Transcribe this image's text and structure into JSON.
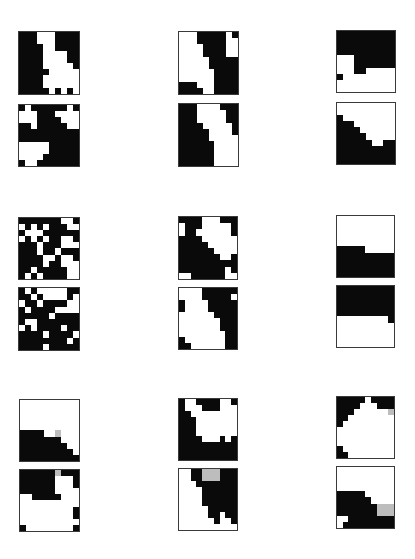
{
  "figure": {
    "layout": "3 rows x 3 columns of panel pairs; each pair = two stacked 10x10 binary grids",
    "colors": {
      "on": "#0a0a0a",
      "off": "#ffffff",
      "border": "#3a3a3a",
      "artifact": "#bdbdbd"
    },
    "panels": [
      {
        "id": "r1c1-top",
        "x": 18,
        "y": 31,
        "w": 62,
        "h": 64,
        "grid": [
          "1110001111",
          "1110001111",
          "1111001111",
          "1111000011",
          "1111000011",
          "1111000001",
          "1111100000",
          "1111000000",
          "1111000000",
          "1111101010"
        ]
      },
      {
        "id": "r1c1-bottom",
        "x": 18,
        "y": 104,
        "w": 62,
        "h": 63,
        "grid": [
          "1011111101",
          "0001110000",
          "0001111000",
          "1101111100",
          "1111111111",
          "1111111111",
          "0000011111",
          "0000011111",
          "0000111111",
          "1001111111"
        ]
      },
      {
        "id": "r1c2-top",
        "x": 178,
        "y": 31,
        "w": 61,
        "h": 64,
        "grid": [
          "0001111101",
          "0001111100",
          "0000111100",
          "0000111100",
          "0000011111",
          "0000011111",
          "0000001111",
          "0000001111",
          "1110001111",
          "1111001111"
        ]
      },
      {
        "id": "r1c2-bottom",
        "x": 178,
        "y": 103,
        "w": 61,
        "h": 64,
        "grid": [
          "1110000111",
          "1110000011",
          "1110000011",
          "1111000001",
          "1111100001",
          "1111100000",
          "1111110000",
          "1111110000",
          "1111110000",
          "1111110000"
        ]
      },
      {
        "id": "r1c3-top",
        "x": 336,
        "y": 30,
        "w": 60,
        "h": 63,
        "grid": [
          "1111111111",
          "1111111111",
          "1111111111",
          "1111111111",
          "0001111111",
          "0001111111",
          "0001100000",
          "1000000000",
          "0000000000",
          "0000000000"
        ]
      },
      {
        "id": "r1c3-bottom",
        "x": 336,
        "y": 102,
        "w": 60,
        "h": 63,
        "grid": [
          "0000000000",
          "0000000000",
          "1000000000",
          "1110000000",
          "1111000000",
          "1111100000",
          "1111110011",
          "1111111111",
          "1111111111",
          "1111111111"
        ]
      },
      {
        "id": "r2c1-top",
        "x": 18,
        "y": 217,
        "w": 62,
        "h": 63,
        "grid": [
          "1111111001",
          "0101011100",
          "1000111111",
          "0101011001",
          "1110111000",
          "1110110111",
          "1111001001",
          "1111011000",
          "1101111100",
          "1010111100"
        ]
      },
      {
        "id": "r2c1-bottom",
        "x": 18,
        "y": 287,
        "w": 62,
        "h": 64,
        "grid": [
          "1010000011",
          "1101000010",
          "0110111100",
          "1011110000",
          "1111101111",
          "1001111111",
          "0101111011",
          "1111011110",
          "1111111101",
          "1111011111"
        ]
      },
      {
        "id": "r2c2-top",
        "x": 178,
        "y": 216,
        "w": 60,
        "h": 64,
        "grid": [
          "1111000111",
          "0111000001",
          "0110000001",
          "1111000000",
          "1111100000",
          "1111110000",
          "1111111001",
          "1111111111",
          "1111111101",
          "0011111100"
        ]
      },
      {
        "id": "r2c2-bottom",
        "x": 178,
        "y": 287,
        "w": 60,
        "h": 63,
        "grid": [
          "0000111111",
          "0000111110",
          "1000011111",
          "1000011111",
          "0000001111",
          "0000000111",
          "0000000111",
          "0000000011",
          "1000000011",
          "1100000011"
        ]
      },
      {
        "id": "r2c3-top",
        "x": 336,
        "y": 215,
        "w": 59,
        "h": 63,
        "grid": [
          "0000000000",
          "0000000000",
          "0000000000",
          "0000000000",
          "0000000000",
          "1111100000",
          "1111111111",
          "1111111111",
          "1111111111",
          "1111111111"
        ]
      },
      {
        "id": "r2c3-bottom",
        "x": 336,
        "y": 285,
        "w": 59,
        "h": 63,
        "grid": [
          "1111111111",
          "1111111111",
          "1111111111",
          "1111111111",
          "1111111111",
          "0000000001",
          "0000000000",
          "0000000000",
          "0000000000",
          "0000000000"
        ]
      },
      {
        "id": "r3c1-top",
        "x": 19,
        "y": 399,
        "w": 61,
        "h": 63,
        "grid": [
          "0000000000",
          "0000000000",
          "0000000000",
          "0000000000",
          "0000000000",
          "1111002000",
          "1111111000",
          "1111111100",
          "1111111110",
          "1111111111"
        ]
      },
      {
        "id": "r3c1-bottom",
        "x": 19,
        "y": 469,
        "w": 61,
        "h": 63,
        "grid": [
          "1111112111",
          "1111110001",
          "1111110001",
          "1111110000",
          "0011111000",
          "0000000000",
          "0000000001",
          "0000000001",
          "0000000000",
          "1000000001"
        ]
      },
      {
        "id": "r3c2-top",
        "x": 178,
        "y": 398,
        "w": 60,
        "h": 63,
        "grid": [
          "1001111001",
          "1000111000",
          "1100000000",
          "1110000000",
          "1110000000",
          "1110000000",
          "1111000101",
          "1111111111",
          "1111111111",
          "1111111111"
        ]
      },
      {
        "id": "r3c2-bottom",
        "x": 178,
        "y": 468,
        "w": 60,
        "h": 63,
        "grid": [
          "0011222111",
          "0011222111",
          "0001111111",
          "0000111111",
          "0000111111",
          "0000111111",
          "0000011111",
          "0000011011",
          "0000001001",
          "0000000000"
        ]
      },
      {
        "id": "r3c3-top",
        "x": 336,
        "y": 396,
        "w": 59,
        "h": 63,
        "grid": [
          "1111101111",
          "1111000111",
          "1110000002",
          "1100000000",
          "1000000000",
          "0000000000",
          "0000000000",
          "0000000000",
          "1000000000",
          "1100000000"
        ]
      },
      {
        "id": "r3c3-bottom",
        "x": 336,
        "y": 466,
        "w": 59,
        "h": 63,
        "grid": [
          "0000000000",
          "0000000000",
          "0000000000",
          "0000000000",
          "1111100000",
          "1111110000",
          "1111111222",
          "1111111222",
          "0011111111",
          "0111111111"
        ]
      }
    ]
  }
}
